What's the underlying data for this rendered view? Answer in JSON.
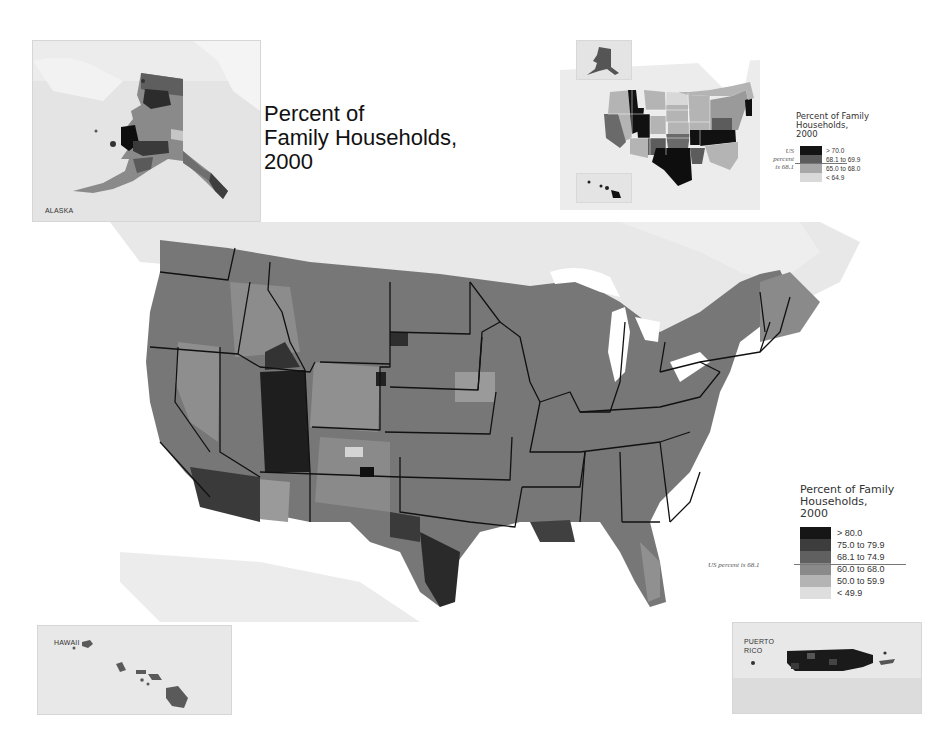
{
  "title": {
    "line1": "Percent of",
    "line2": "Family Households,",
    "line3": "2000"
  },
  "insets": {
    "alaska": {
      "label": "ALASKA"
    },
    "hawaii": {
      "label": "HAWAII"
    },
    "puerto_rico": {
      "label_line1": "PUERTO",
      "label_line2": "RICO"
    }
  },
  "state_legend": {
    "title_line1": "Percent of Family",
    "title_line2": "Households,",
    "title_line3": "2000",
    "us_note_line1": "US",
    "us_note_line2": "percent",
    "us_note_line3": "is 68.1",
    "classes": [
      {
        "label": "> 70.0",
        "color": "#141414"
      },
      {
        "label": "68.1 to 69.9",
        "color": "#5c5c5c"
      },
      {
        "label": "65.0 to 68.0",
        "color": "#a8a8a8"
      },
      {
        "label": "< 64.9",
        "color": "#d9d9d9"
      }
    ]
  },
  "county_legend": {
    "title_line1": "Percent of Family",
    "title_line2": "Households,",
    "title_line3": "2000",
    "us_note": "US percent is 68.1",
    "classes": [
      {
        "label": "> 80.0",
        "color": "#161616"
      },
      {
        "label": "75.0 to 79.9",
        "color": "#3d3d3d"
      },
      {
        "label": "68.1 to 74.9",
        "color": "#606060"
      },
      {
        "label": "60.0 to 68.0",
        "color": "#8a8a8a"
      },
      {
        "label": "50.0 to 59.9",
        "color": "#b4b4b4"
      },
      {
        "label": "< 49.9",
        "color": "#dedede"
      }
    ]
  },
  "colors": {
    "land_background": "#e6e6e6",
    "water": "#ffffff",
    "state_border": "#111111"
  }
}
